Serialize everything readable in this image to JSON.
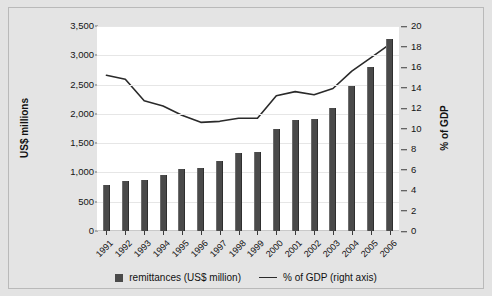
{
  "chart_data": {
    "type": "bar",
    "title": "",
    "xlabel": "",
    "ylabel": "US$ millions",
    "ylabel_right": "% of GDP",
    "ylim": [
      0,
      3500
    ],
    "ylim_right": [
      0,
      20
    ],
    "ytick_step": 500,
    "ytick_step_right": 2,
    "grid": true,
    "legend_position": "bottom",
    "categories": [
      "1991",
      "1992",
      "1993",
      "1994",
      "1995",
      "1996",
      "1997",
      "1998",
      "1999",
      "2000",
      "2001",
      "2002",
      "2003",
      "2004",
      "2005",
      "2006"
    ],
    "yticks_left": [
      "3,500",
      "3,000",
      "2,500",
      "2,000",
      "1,500",
      "1,000",
      "500",
      "0"
    ],
    "yticks_left_values": [
      3500,
      3000,
      2500,
      2000,
      1500,
      1000,
      500,
      0
    ],
    "yticks_right": [
      "20",
      "18",
      "16",
      "14",
      "12",
      "10",
      "8",
      "6",
      "4",
      "2",
      "0"
    ],
    "yticks_right_values": [
      20,
      18,
      16,
      14,
      12,
      10,
      8,
      6,
      4,
      2,
      0
    ],
    "series": [
      {
        "name": "remittances (US$ million)",
        "type": "bar",
        "axis": "left",
        "color": "#4a4a4a",
        "values": [
          790,
          850,
          865,
          960,
          1055,
          1075,
          1190,
          1325,
          1350,
          1750,
          1890,
          1920,
          2100,
          2470,
          2800,
          3280
        ]
      },
      {
        "name": "% of GDP (right axis)",
        "type": "line",
        "axis": "right",
        "color": "#2a2a2a",
        "values": [
          15.2,
          14.8,
          12.7,
          12.2,
          11.3,
          10.6,
          10.7,
          11.0,
          11.0,
          13.2,
          13.6,
          13.3,
          13.9,
          15.6,
          16.9,
          18.2
        ]
      }
    ],
    "legend": [
      {
        "label": "remittances (US$ million)",
        "marker": "square",
        "color": "#4a4a4a"
      },
      {
        "label": "% of GDP (right axis)",
        "marker": "line",
        "color": "#2a2a2a"
      }
    ]
  }
}
